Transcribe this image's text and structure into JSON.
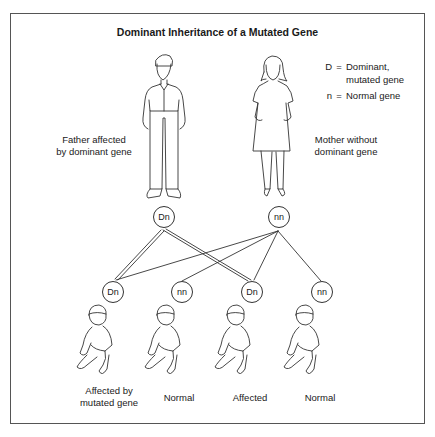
{
  "title": "Dominant Inheritance of a Mutated Gene",
  "legend": {
    "items": [
      {
        "key": "D",
        "sep": "=",
        "line1": "Dominant,",
        "line2": "mutated gene"
      },
      {
        "key": "n",
        "sep": "=",
        "line1": "Normal gene",
        "line2": ""
      }
    ]
  },
  "parents": {
    "father": {
      "label_line1": "Father affected",
      "label_line2": "by dominant gene",
      "genotype": "Dn",
      "figure_icon": "man-figure-icon"
    },
    "mother": {
      "label_line1": "Mother without",
      "label_line2": "dominant gene",
      "genotype": "nn",
      "figure_icon": "woman-figure-icon"
    }
  },
  "children": [
    {
      "genotype": "Dn",
      "label_line1": "Affected by",
      "label_line2": "mutated gene"
    },
    {
      "genotype": "nn",
      "label_line1": "",
      "label_line2": "Normal"
    },
    {
      "genotype": "Dn",
      "label_line1": "",
      "label_line2": "Affected"
    },
    {
      "genotype": "nn",
      "label_line1": "",
      "label_line2": "Normal"
    }
  ],
  "colors": {
    "line": "#333333",
    "border": "#555555",
    "background": "#ffffff"
  }
}
